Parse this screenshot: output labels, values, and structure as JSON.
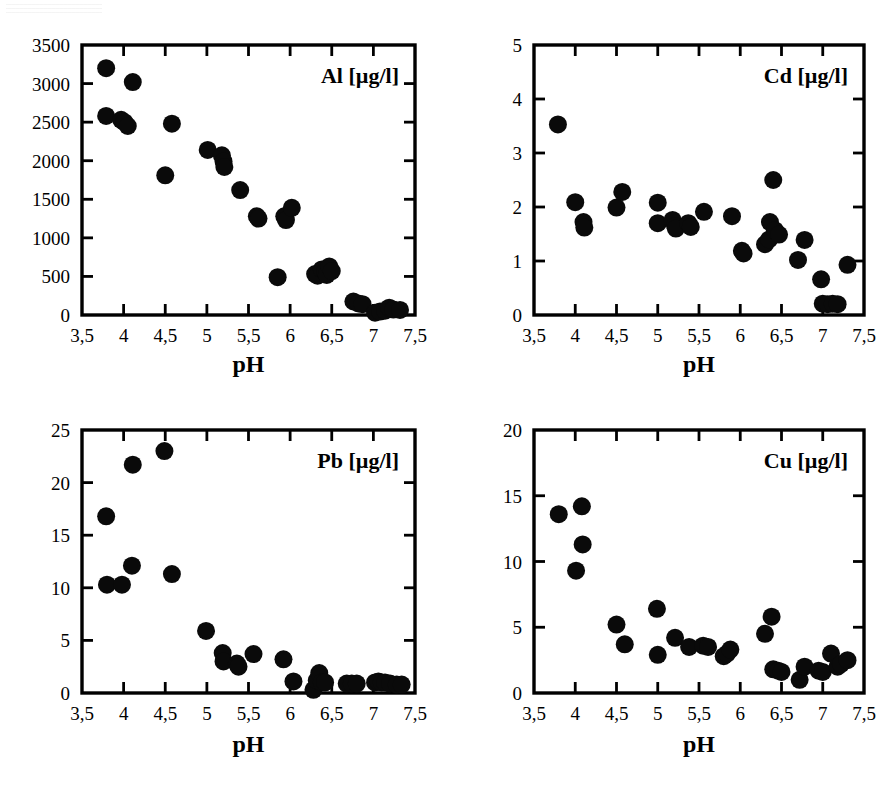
{
  "figure": {
    "background_color": "#ffffff",
    "marker_color": "#0a0a0a",
    "axis_color": "#000000",
    "panel_count": 4
  },
  "chart_data": [
    {
      "type": "scatter",
      "title": "Al [µg/l]",
      "element": "Al",
      "unit": "µg/l",
      "xlabel": "pH",
      "ylabel": "",
      "xlim": [
        3.5,
        7.5
      ],
      "ylim": [
        0,
        3500
      ],
      "xticks": [
        3.5,
        4,
        4.5,
        5,
        5.5,
        6,
        6.5,
        7,
        7.5
      ],
      "xticklabels": [
        "3,5",
        "4",
        "4,5",
        "5",
        "5,5",
        "6",
        "6,5",
        "7",
        "7,5"
      ],
      "yticks": [
        0,
        500,
        1000,
        1500,
        2000,
        2500,
        3000,
        3500
      ],
      "yticklabels": [
        "0",
        "500",
        "1000",
        "1500",
        "2000",
        "2500",
        "3000",
        "3500"
      ],
      "grid": false,
      "legend": "none",
      "marker": "filled-circle",
      "points": [
        [
          3.79,
          3200
        ],
        [
          3.79,
          2580
        ],
        [
          3.97,
          2530
        ],
        [
          4.01,
          2500
        ],
        [
          4.05,
          2450
        ],
        [
          4.11,
          3020
        ],
        [
          4.5,
          1810
        ],
        [
          4.58,
          2480
        ],
        [
          5.01,
          2140
        ],
        [
          5.18,
          2070
        ],
        [
          5.2,
          1990
        ],
        [
          5.21,
          1920
        ],
        [
          5.4,
          1620
        ],
        [
          5.6,
          1280
        ],
        [
          5.62,
          1250
        ],
        [
          5.85,
          490
        ],
        [
          5.93,
          1280
        ],
        [
          5.95,
          1230
        ],
        [
          6.02,
          1390
        ],
        [
          6.3,
          530
        ],
        [
          6.33,
          510
        ],
        [
          6.38,
          590
        ],
        [
          6.42,
          560
        ],
        [
          6.44,
          520
        ],
        [
          6.47,
          630
        ],
        [
          6.5,
          570
        ],
        [
          6.76,
          175
        ],
        [
          6.82,
          150
        ],
        [
          6.87,
          140
        ],
        [
          7.02,
          30
        ],
        [
          7.08,
          45
        ],
        [
          7.14,
          55
        ],
        [
          7.19,
          95
        ],
        [
          7.24,
          70
        ],
        [
          7.32,
          65
        ]
      ]
    },
    {
      "type": "scatter",
      "title": "Cd [µg/l]",
      "element": "Cd",
      "unit": "µg/l",
      "xlabel": "pH",
      "ylabel": "",
      "xlim": [
        3.5,
        7.5
      ],
      "ylim": [
        0,
        5
      ],
      "xticks": [
        3.5,
        4,
        4.5,
        5,
        5.5,
        6,
        6.5,
        7,
        7.5
      ],
      "xticklabels": [
        "3,5",
        "4",
        "4,5",
        "5",
        "5,5",
        "6",
        "6,5",
        "7",
        "7,5"
      ],
      "yticks": [
        0,
        1,
        2,
        3,
        4,
        5
      ],
      "yticklabels": [
        "0",
        "1",
        "2",
        "3",
        "4",
        "5"
      ],
      "grid": false,
      "legend": "none",
      "marker": "filled-circle",
      "points": [
        [
          3.79,
          3.53
        ],
        [
          4.0,
          2.09
        ],
        [
          4.1,
          1.72
        ],
        [
          4.11,
          1.62
        ],
        [
          4.5,
          1.99
        ],
        [
          4.57,
          2.28
        ],
        [
          5.0,
          2.08
        ],
        [
          5.0,
          1.7
        ],
        [
          5.18,
          1.76
        ],
        [
          5.21,
          1.65
        ],
        [
          5.22,
          1.6
        ],
        [
          5.37,
          1.7
        ],
        [
          5.4,
          1.63
        ],
        [
          5.56,
          1.91
        ],
        [
          5.9,
          1.83
        ],
        [
          6.02,
          1.19
        ],
        [
          6.04,
          1.14
        ],
        [
          6.3,
          1.31
        ],
        [
          6.35,
          1.4
        ],
        [
          6.36,
          1.72
        ],
        [
          6.4,
          2.5
        ],
        [
          6.42,
          1.57
        ],
        [
          6.47,
          1.49
        ],
        [
          6.7,
          1.02
        ],
        [
          6.78,
          1.39
        ],
        [
          6.98,
          0.66
        ],
        [
          7.0,
          0.21
        ],
        [
          7.06,
          0.2
        ],
        [
          7.12,
          0.21
        ],
        [
          7.18,
          0.2
        ],
        [
          7.3,
          0.93
        ]
      ]
    },
    {
      "type": "scatter",
      "title": "Pb [µg/l]",
      "element": "Pb",
      "unit": "µg/l",
      "xlabel": "pH",
      "ylabel": "",
      "xlim": [
        3.5,
        7.5
      ],
      "ylim": [
        0,
        25
      ],
      "xticks": [
        3.5,
        4,
        4.5,
        5,
        5.5,
        6,
        6.5,
        7,
        7.5
      ],
      "xticklabels": [
        "3,5",
        "4",
        "4,5",
        "5",
        "5,5",
        "6",
        "6,5",
        "7",
        "7,5"
      ],
      "yticks": [
        0,
        5,
        10,
        15,
        20,
        25
      ],
      "yticklabels": [
        "0",
        "5",
        "10",
        "15",
        "20",
        "25"
      ],
      "grid": false,
      "legend": "none",
      "marker": "filled-circle",
      "points": [
        [
          3.79,
          16.8
        ],
        [
          3.8,
          10.3
        ],
        [
          3.98,
          10.3
        ],
        [
          4.1,
          12.1
        ],
        [
          4.11,
          21.7
        ],
        [
          4.49,
          23.0
        ],
        [
          4.58,
          11.3
        ],
        [
          4.99,
          5.9
        ],
        [
          5.19,
          3.8
        ],
        [
          5.2,
          3.0
        ],
        [
          5.36,
          2.8
        ],
        [
          5.38,
          2.5
        ],
        [
          5.56,
          3.7
        ],
        [
          5.92,
          3.2
        ],
        [
          6.04,
          1.1
        ],
        [
          6.28,
          0.3
        ],
        [
          6.32,
          1.2
        ],
        [
          6.35,
          1.9
        ],
        [
          6.38,
          1.0
        ],
        [
          6.42,
          1.0
        ],
        [
          6.68,
          0.9
        ],
        [
          6.74,
          0.9
        ],
        [
          6.8,
          0.9
        ],
        [
          7.02,
          1.0
        ],
        [
          7.06,
          1.1
        ],
        [
          7.1,
          1.0
        ],
        [
          7.14,
          1.0
        ],
        [
          7.2,
          0.9
        ],
        [
          7.28,
          0.8
        ],
        [
          7.34,
          0.8
        ]
      ]
    },
    {
      "type": "scatter",
      "title": "Cu [µg/l]",
      "element": "Cu",
      "unit": "µg/l",
      "xlabel": "pH",
      "ylabel": "",
      "xlim": [
        3.5,
        7.5
      ],
      "ylim": [
        0,
        20
      ],
      "xticks": [
        3.5,
        4,
        4.5,
        5,
        5.5,
        6,
        6.5,
        7,
        7.5
      ],
      "xticklabels": [
        "3,5",
        "4",
        "4,5",
        "5",
        "5,5",
        "6",
        "6,5",
        "7",
        "7,5"
      ],
      "yticks": [
        0,
        5,
        10,
        15,
        20
      ],
      "yticklabels": [
        "0",
        "5",
        "10",
        "15",
        "20"
      ],
      "grid": false,
      "legend": "none",
      "marker": "filled-circle",
      "points": [
        [
          3.8,
          13.6
        ],
        [
          4.01,
          9.3
        ],
        [
          4.08,
          14.2
        ],
        [
          4.09,
          11.3
        ],
        [
          4.5,
          5.2
        ],
        [
          4.6,
          3.7
        ],
        [
          4.99,
          6.4
        ],
        [
          5.0,
          2.9
        ],
        [
          5.21,
          4.2
        ],
        [
          5.38,
          3.5
        ],
        [
          5.55,
          3.6
        ],
        [
          5.61,
          3.5
        ],
        [
          5.8,
          2.8
        ],
        [
          5.84,
          3.0
        ],
        [
          5.88,
          3.3
        ],
        [
          6.3,
          4.5
        ],
        [
          6.38,
          5.8
        ],
        [
          6.4,
          1.8
        ],
        [
          6.46,
          1.7
        ],
        [
          6.5,
          1.6
        ],
        [
          6.72,
          1.0
        ],
        [
          6.78,
          2.0
        ],
        [
          6.95,
          1.7
        ],
        [
          7.0,
          1.6
        ],
        [
          7.1,
          3.0
        ],
        [
          7.18,
          2.0
        ],
        [
          7.22,
          2.2
        ],
        [
          7.3,
          2.5
        ]
      ]
    }
  ]
}
